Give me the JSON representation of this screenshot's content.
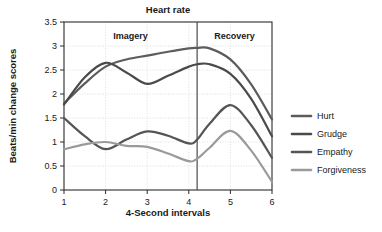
{
  "chart_data": {
    "type": "line",
    "title": "Heart rate",
    "xlabel": "4-Second intervals",
    "ylabel": "Beats/min change scores",
    "xlim": [
      1,
      6
    ],
    "ylim": [
      0,
      3.5
    ],
    "ytick_labels": [
      "0",
      "0.5",
      "1",
      "1.5",
      "2",
      "2.5",
      "3",
      "3.5"
    ],
    "ytick_values": [
      0,
      0.5,
      1,
      1.5,
      2,
      2.5,
      3,
      3.5
    ],
    "xtick_labels": [
      "1",
      "2",
      "3",
      "4",
      "5",
      "6"
    ],
    "xtick_values": [
      1,
      2,
      3,
      4,
      5,
      6
    ],
    "grid": true,
    "legend_position": "right",
    "x": [
      1,
      1.5,
      2,
      2.5,
      3,
      3.5,
      4,
      4.2,
      4.5,
      5,
      5.5,
      6
    ],
    "series": [
      {
        "name": "Hurt",
        "color": "#5c5c5c",
        "values": [
          1.8,
          2.22,
          2.57,
          2.72,
          2.8,
          2.88,
          2.95,
          2.96,
          2.95,
          2.72,
          2.2,
          1.47
        ]
      },
      {
        "name": "Grudge",
        "color": "#4a4a4a",
        "values": [
          1.78,
          2.35,
          2.65,
          2.45,
          2.21,
          2.38,
          2.57,
          2.62,
          2.62,
          2.42,
          1.9,
          1.12
        ]
      },
      {
        "name": "Empathy",
        "color": "#555555",
        "values": [
          1.5,
          1.12,
          0.85,
          1.05,
          1.22,
          1.13,
          0.97,
          1.05,
          1.38,
          1.77,
          1.35,
          0.67
        ]
      },
      {
        "name": "Forgiveness",
        "color": "#9a9a9a",
        "values": [
          0.85,
          0.95,
          1.0,
          0.92,
          0.9,
          0.76,
          0.6,
          0.65,
          0.88,
          1.23,
          0.82,
          0.17
        ]
      }
    ],
    "panels": [
      {
        "label": "Imagery",
        "x_start": 1,
        "x_end": 4.2
      },
      {
        "label": "Recovery",
        "x_start": 4.2,
        "x_end": 6
      }
    ],
    "divider_x": 4.2
  },
  "legend": {
    "items": [
      {
        "label": "Hurt"
      },
      {
        "label": "Grudge"
      },
      {
        "label": "Empathy"
      },
      {
        "label": "Forgiveness"
      }
    ]
  }
}
